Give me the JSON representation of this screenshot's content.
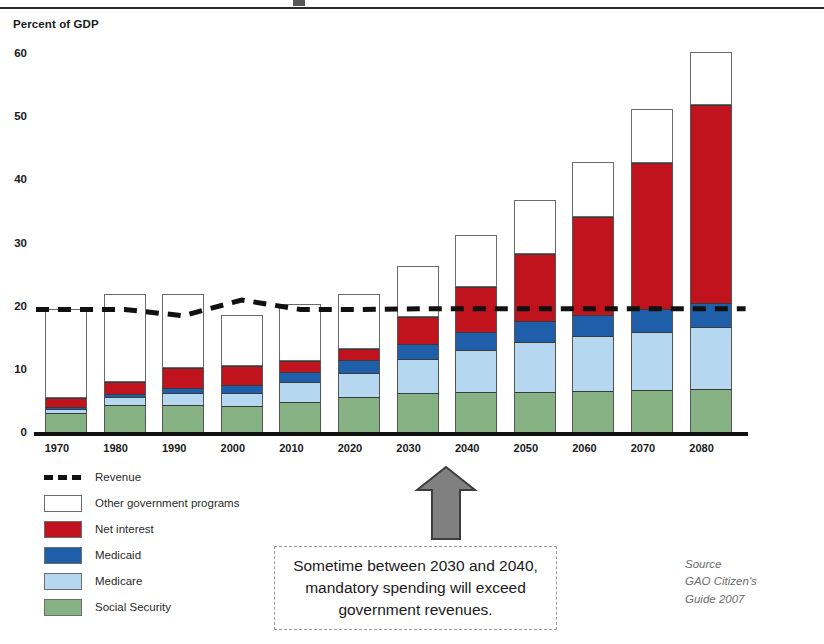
{
  "chart_data": {
    "type": "bar",
    "title": "",
    "subtitle": "",
    "xlabel": "",
    "ylabel": "Percent of GDP",
    "ylim": [
      0,
      60
    ],
    "yticks": [
      0,
      10,
      20,
      30,
      40,
      50,
      60
    ],
    "grid": false,
    "stacked": true,
    "legend_position": "below-left",
    "categories": [
      "1970",
      "1980",
      "1990",
      "2000",
      "2010",
      "2020",
      "2030",
      "2040",
      "2050",
      "2060",
      "2070",
      "2080"
    ],
    "series": [
      {
        "name": "Social Security",
        "color": "#85b183",
        "values": [
          3.0,
          4.3,
          4.3,
          4.1,
          4.8,
          5.6,
          6.2,
          6.4,
          6.4,
          6.5,
          6.6,
          6.8
        ]
      },
      {
        "name": "Medicare",
        "color": "#b5d7ef",
        "values": [
          0.7,
          1.2,
          1.8,
          2.1,
          3.1,
          3.8,
          5.3,
          6.6,
          7.9,
          8.7,
          9.3,
          9.8
        ]
      },
      {
        "name": "Medicaid",
        "color": "#1f5fa9",
        "values": [
          0.3,
          0.5,
          0.8,
          1.2,
          1.6,
          2.0,
          2.5,
          2.9,
          3.2,
          3.4,
          3.6,
          3.8
        ]
      },
      {
        "name": "Net interest",
        "color": "#c0131e",
        "values": [
          1.4,
          1.9,
          3.2,
          3.0,
          1.8,
          1.7,
          4.2,
          7.1,
          10.7,
          15.4,
          23.1,
          31.4
        ]
      },
      {
        "name": "Other government programs",
        "color": "#ffffff",
        "values": [
          14.1,
          14.0,
          11.8,
          8.1,
          9.0,
          8.8,
          8.1,
          8.2,
          8.5,
          8.7,
          8.5,
          8.4
        ]
      }
    ],
    "totals": [
      19.5,
      21.9,
      21.9,
      18.5,
      20.3,
      21.9,
      26.3,
      31.2,
      36.7,
      42.7,
      51.1,
      60.2
    ],
    "line_series": {
      "name": "Revenue",
      "style": "dashed-black",
      "values": [
        19.4,
        19.4,
        18.4,
        20.9,
        19.4,
        19.4,
        19.5,
        19.5,
        19.5,
        19.5,
        19.5,
        19.5
      ]
    },
    "annotations": [
      {
        "name": "callout",
        "text": "Sometime between 2030 and 2040, mandatory spending will exceed government revenues.",
        "points_to": "2030"
      }
    ]
  },
  "axis": {
    "y_title": "Percent of GDP"
  },
  "legend": {
    "items": [
      {
        "key": "revenue",
        "label": "Revenue",
        "swatch": "sw-revenue"
      },
      {
        "key": "other",
        "label": "Other government programs",
        "swatch": "sw-other"
      },
      {
        "key": "interest",
        "label": "Net interest",
        "swatch": "sw-interest"
      },
      {
        "key": "medicaid",
        "label": "Medicaid",
        "swatch": "sw-medicaid"
      },
      {
        "key": "medicare",
        "label": "Medicare",
        "swatch": "sw-medicare"
      },
      {
        "key": "ss",
        "label": "Social Security",
        "swatch": "sw-ss"
      }
    ]
  },
  "callout": {
    "line1": "Sometime between 2030 and 2040,",
    "line2": "mandatory spending will exceed",
    "line3": "government revenues."
  },
  "source": {
    "line1": "Source",
    "line2": "GAO Citizen's",
    "line3": "Guide 2007"
  },
  "colors": {
    "social_security": "#85b183",
    "medicare": "#b5d7ef",
    "medicaid": "#1f5fa9",
    "net_interest": "#c0131e",
    "other_programs": "#ffffff",
    "revenue_line": "#111111",
    "arrow": "#808080"
  }
}
